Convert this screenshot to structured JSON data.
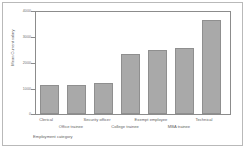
{
  "chart_data": {
    "type": "bar",
    "title": "",
    "subtitle": "",
    "xlabel": "Employment category",
    "ylabel": "Mean Current salary",
    "categories": [
      "Clerical",
      "Office trainee",
      "Security officer",
      "College trainee",
      "Exempt employee",
      "MBA trainee",
      "Technical"
    ],
    "values": [
      1130,
      1130,
      1200,
      2350,
      2500,
      2580,
      3700
    ],
    "ylim": [
      0,
      4000
    ],
    "yticks": [
      0,
      1000,
      2000,
      3000,
      4000
    ],
    "ytick_labels": [
      "0",
      "1000",
      "2000",
      "3000",
      "4000"
    ],
    "grid": false,
    "legend": false,
    "legend_position": "none",
    "bar_color": "#a9a9a9",
    "bar_edge_color": "#8f8f8f",
    "axis_color": "#8c8c8c",
    "text_color": "#5f5f5f",
    "background": "#ffffff",
    "border_color": "#b9b9b9"
  }
}
